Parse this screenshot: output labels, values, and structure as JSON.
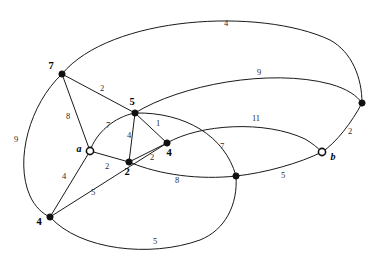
{
  "diagram": {
    "type": "node-link-graph",
    "background_color": "#ffffff",
    "stroke_color": "#1a1a1a",
    "width": 379,
    "height": 264,
    "nodes": [
      {
        "id": "n7",
        "label": "7",
        "x": 62,
        "y": 74,
        "style": "filled",
        "label_dx": -11,
        "label_dy": -7
      },
      {
        "id": "n5",
        "label": "5",
        "x": 135,
        "y": 113,
        "style": "filled",
        "label_dx": -3,
        "label_dy": -10
      },
      {
        "id": "na",
        "label": "a",
        "x": 90,
        "y": 151,
        "style": "hollow",
        "label_dx": -11,
        "label_dy": -1
      },
      {
        "id": "n2",
        "label": "2",
        "x": 129,
        "y": 162,
        "style": "filled",
        "label_dx": -2,
        "label_dy": 11
      },
      {
        "id": "n4r",
        "label": "4",
        "x": 167,
        "y": 143,
        "style": "filled",
        "label_dx": 2,
        "label_dy": 11
      },
      {
        "id": "n4b",
        "label": "4",
        "x": 50,
        "y": 217,
        "style": "filled",
        "label_dx": -11,
        "label_dy": 6
      },
      {
        "id": "nb",
        "label": "b",
        "x": 322,
        "y": 152,
        "style": "hollow",
        "label_dx": 11,
        "label_dy": 6
      },
      {
        "id": "ntr",
        "label": "",
        "x": 362,
        "y": 103,
        "style": "filled",
        "label_dx": 0,
        "label_dy": 0
      },
      {
        "id": "nm",
        "label": "",
        "x": 236,
        "y": 176,
        "style": "filled",
        "label_dx": 0,
        "label_dy": 0
      }
    ],
    "edges": [
      {
        "id": "e_7_tr",
        "from": "n7",
        "to": "ntr",
        "weight": "4",
        "label_x": 226,
        "label_y": 24,
        "path": "M 62 74 C 110 16 260 7 330 40 C 352 52 362 78 362 103"
      },
      {
        "id": "e_7_5",
        "from": "n7",
        "to": "n5",
        "weight": "2",
        "label_x": 102,
        "label_y": 89,
        "path": "M 62 74 L 135 113"
      },
      {
        "id": "e_7_a",
        "from": "n7",
        "to": "na",
        "weight": "8",
        "label_x": 68,
        "label_y": 117,
        "path": "M 62 74 L 90 151"
      },
      {
        "id": "e_7_4b",
        "from": "n7",
        "to": "n4b",
        "weight": "9",
        "label_x": 16,
        "label_y": 140,
        "path": "M 62 74 C 30 104 14 160 30 196 C 35 207 43 214 50 217"
      },
      {
        "id": "e_a_5",
        "from": "na",
        "to": "n5",
        "weight": "7",
        "label_x": 108,
        "label_y": 126,
        "path": "M 90 151 C 96 133 114 117 135 113"
      },
      {
        "id": "e_a_2",
        "from": "na",
        "to": "n2",
        "weight": "2",
        "label_x": 107,
        "label_y": 167,
        "path": "M 90 151 L 129 162"
      },
      {
        "id": "e_a_4b",
        "from": "na",
        "to": "n4b",
        "weight": "4",
        "label_x": 64,
        "label_y": 177,
        "path": "M 90 151 L 50 217"
      },
      {
        "id": "e_5_2",
        "from": "n5",
        "to": "n2",
        "weight": "4",
        "label_x": 129,
        "label_y": 136,
        "path": "M 135 113 L 129 162"
      },
      {
        "id": "e_5_4r",
        "from": "n5",
        "to": "n4r",
        "weight": "1",
        "label_x": 158,
        "label_y": 124,
        "path": "M 135 113 L 167 143"
      },
      {
        "id": "e_2_4r",
        "from": "n2",
        "to": "n4r",
        "weight": "2",
        "label_x": 152,
        "label_y": 158,
        "path": "M 129 162 L 167 143"
      },
      {
        "id": "e_4b_2x",
        "from": "n4b",
        "to": "n5",
        "weight": "5",
        "label_x": 93,
        "label_y": 193,
        "path": "M 50 217 L 167 143"
      },
      {
        "id": "e_4b_nm",
        "from": "n4b",
        "to": "nm",
        "weight": "5",
        "label_x": 155,
        "label_y": 242,
        "path": "M 50 217 C 80 250 150 258 200 240 C 225 230 238 205 236 176"
      },
      {
        "id": "e_2_nm",
        "from": "n2",
        "to": "nm",
        "weight": "8",
        "label_x": 177,
        "label_y": 181,
        "path": "M 129 162 C 160 175 200 180 236 176"
      },
      {
        "id": "e_nm_b",
        "from": "nm",
        "to": "nb",
        "weight": "5",
        "label_x": 283,
        "label_y": 176,
        "path": "M 236 176 C 265 173 300 163 322 152"
      },
      {
        "id": "e_4r_b",
        "from": "n4r",
        "to": "nb",
        "weight": "11",
        "label_x": 256,
        "label_y": 119,
        "path": "M 167 143 C 200 124 265 120 305 139 C 312 143 318 148 322 152"
      },
      {
        "id": "e_5_tr",
        "from": "n5",
        "to": "ntr",
        "weight": "9",
        "label_x": 259,
        "label_y": 73,
        "path": "M 135 113 C 180 85 270 68 330 84 C 348 89 357 96 362 103"
      },
      {
        "id": "e_b_tr",
        "from": "nb",
        "to": "ntr",
        "weight": "2",
        "label_x": 350,
        "label_y": 132,
        "path": "M 322 152 C 336 143 352 122 362 103"
      },
      {
        "id": "e_5_nm",
        "from": "n5",
        "to": "nm",
        "weight": "7",
        "label_x": 222,
        "label_y": 147,
        "path": "M 135 113 C 185 112 225 136 236 176"
      }
    ]
  }
}
